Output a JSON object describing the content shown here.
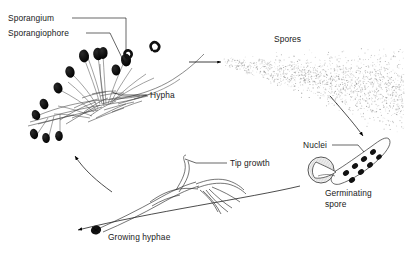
{
  "figure": {
    "kind": "biology-life-cycle-diagram",
    "background_color": "#ffffff",
    "ink_color": "#000000",
    "stipple_color": "#8a8a8a"
  },
  "labels": {
    "sporangium": "Sporangium",
    "sporangiophore": "Sporangiophore",
    "hypha": "Hypha",
    "spores": "Spores",
    "nuclei": "Nuclei",
    "germinating_spore_line1": "Germinating",
    "germinating_spore_line2": "spore",
    "tip_growth": "Tip growth",
    "growing_hyphae": "Growing hyphae"
  },
  "structures": {
    "mycelium_cluster": {
      "name": "sporangiophore-cluster",
      "sporangia_count": 12,
      "description": "Black ovoid sporangia borne on slender curved sporangiophores rising from a tangled mycelial base"
    },
    "spore_cloud": {
      "name": "spore-cloud",
      "description": "Fan-shaped stippled cloud of dispersing spores widening to the right",
      "dot_count": 1500
    },
    "germinating_spore": {
      "name": "germinating-spore",
      "nuclei_count": 8,
      "description": "Hatched round spore body with an emerging germ tube containing dark nuclei"
    },
    "growing_hyphae": {
      "name": "growing-hyphae",
      "description": "Branched tubular hyphae growing from a dark spore, with elongating tips"
    }
  },
  "arrows": [
    {
      "name": "arrow-sporangia-to-spores",
      "from": "sporangia",
      "to": "spore cloud",
      "direction": "right"
    },
    {
      "name": "arrow-spores-to-germinating-spore",
      "from": "spore cloud",
      "to": "germinating spore",
      "direction": "down-right curved"
    },
    {
      "name": "arrow-germinating-to-growing-hyphae",
      "from": "germinating spore",
      "to": "growing hyphae",
      "direction": "left curved"
    },
    {
      "name": "arrow-growing-hyphae-to-mycelium",
      "from": "growing hyphae",
      "to": "mycelium cluster",
      "direction": "up-left curved"
    }
  ]
}
